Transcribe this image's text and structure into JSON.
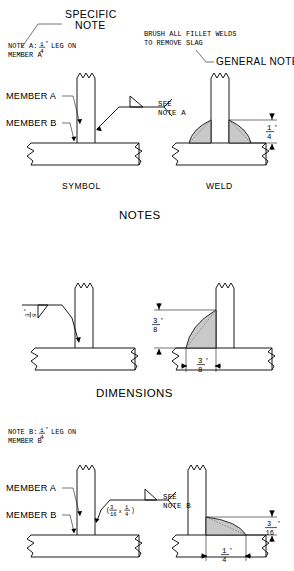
{
  "document": {
    "title": "Fillet Weld Symbol and Weld Comparison Plates",
    "type": "technical-welding-drawing"
  },
  "sections": [
    {
      "id": "notes",
      "heading": "NOTES",
      "callouts": {
        "specific_note_label": "SPECIFIC",
        "specific_note_label2": "NOTE",
        "specific_note_text_line1": "NOTE A:",
        "specific_note_size": "1/4\"",
        "specific_note_text_line2": "LEG ON",
        "specific_note_text_line3": "MEMBER A",
        "general_note_line1": "BRUSH ALL FILLET WELDS",
        "general_note_line2": "TO REMOVE SLAG",
        "general_note_label": "GENERAL NOTE"
      },
      "member_labels": {
        "member_a": "MEMBER A",
        "member_b": "MEMBER B"
      },
      "symbol_tail": {
        "line1": "SEE",
        "line2": "NOTE A"
      },
      "captions": {
        "left": "SYMBOL",
        "right": "WELD"
      },
      "dimensions": [
        {
          "name": "weld-leg-vertical",
          "numerator": "1",
          "denominator": "4",
          "unit": "\"",
          "orientation": "vertical"
        }
      ]
    },
    {
      "id": "dimensions",
      "heading": "DIMENSIONS",
      "symbol_size": {
        "numerator": "3",
        "denominator": "8",
        "unit": "\""
      },
      "dimensions": [
        {
          "name": "weld-leg-vertical",
          "numerator": "3",
          "denominator": "8",
          "unit": "\"",
          "orientation": "vertical"
        },
        {
          "name": "weld-leg-horizontal",
          "numerator": "3",
          "denominator": "8",
          "unit": "\"",
          "orientation": "horizontal"
        }
      ]
    },
    {
      "id": "unequal-leg",
      "heading": "",
      "callouts": {
        "note_b_line1": "NOTE B:",
        "note_b_size": "1/4\"",
        "note_b_line2": "LEG ON",
        "note_b_line3": "MEMBER B"
      },
      "member_labels": {
        "member_a": "MEMBER A",
        "member_b": "MEMBER B"
      },
      "symbol_size_text": "(3/16 x 1/4)",
      "symbol_size_parts": {
        "open": "(",
        "first_num": "3",
        "first_den": "16",
        "times": "x",
        "second_num": "1",
        "second_den": "4",
        "close": ")"
      },
      "symbol_tail": {
        "line1": "SEE",
        "line2": "NOTE B"
      },
      "dimensions": [
        {
          "name": "weld-leg-vertical",
          "numerator": "3",
          "denominator": "16",
          "unit": "\"",
          "orientation": "vertical"
        },
        {
          "name": "weld-leg-horizontal",
          "numerator": "1",
          "denominator": "4",
          "unit": "\"",
          "orientation": "horizontal"
        }
      ]
    }
  ],
  "colors": {
    "line": "#000000",
    "weld_fill": "#c9c9c9",
    "background": "#ffffff"
  }
}
